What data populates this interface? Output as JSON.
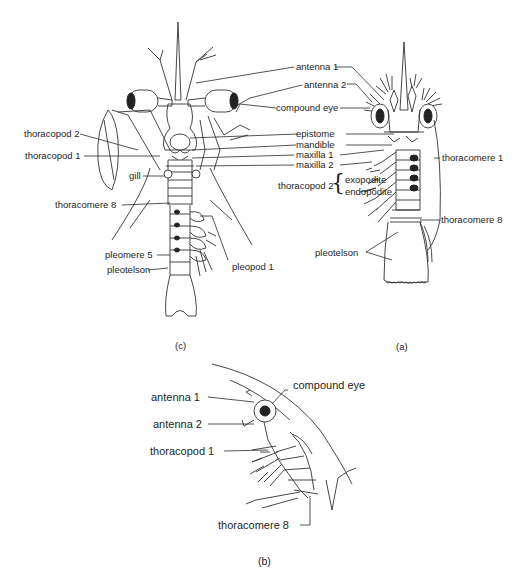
{
  "figure": {
    "panels": [
      {
        "id": "c",
        "caption": "(c)",
        "labels": {
          "thoracopod_2": "thoracopod 2",
          "thoracopod_1": "thoracopod 1",
          "gill": "gill",
          "thoracomere_8": "thoracomere 8",
          "pleomere_5": "pleomere 5",
          "pleotelson": "pleotelson",
          "pleopod_1": "pleopod 1"
        }
      },
      {
        "id": "a",
        "caption": "(a)",
        "labels": {
          "thoracomere_1": "thoracomere 1",
          "thoracopod_2": "thoracopod 2",
          "exopodite": "exopodite",
          "endopodite": "endopodite",
          "thoracomere_8": "thoracomere 8",
          "pleotelson": "pleotelson"
        }
      },
      {
        "id": "b",
        "caption": "(b)",
        "labels": {
          "compound_eye": "compound eye",
          "antenna_1": "antenna 1",
          "antenna_2": "antenna 2",
          "thoracopod_1": "thoracopod 1",
          "thoracomere_8": "thoracomere 8"
        }
      }
    ],
    "shared_labels": {
      "antenna_1": "antenna 1",
      "antenna_2": "antenna 2",
      "compound_eye": "compound eye",
      "epistome": "epistome",
      "mandible": "mandible",
      "maxilla_1": "maxilla 1",
      "maxilla_2": "maxilla 2"
    },
    "brace_glyph": "{"
  }
}
